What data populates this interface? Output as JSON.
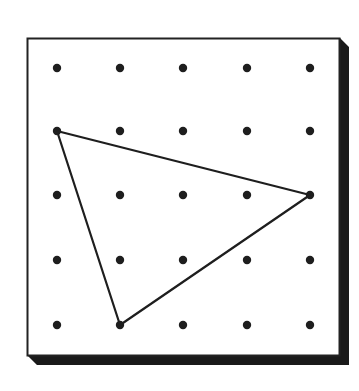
{
  "figure": {
    "type": "geoboard",
    "grid": {
      "rows": 5,
      "cols": 5
    },
    "dot_color": "#1e1e1e",
    "line_color": "#1e1e1e",
    "board_border_color": "#222222",
    "shadow_color": "#1a1a1a",
    "triangle_vertices_grid": [
      [
        0,
        1
      ],
      [
        4,
        2
      ],
      [
        1,
        4
      ]
    ],
    "triangle_label": "triangle on geoboard"
  }
}
